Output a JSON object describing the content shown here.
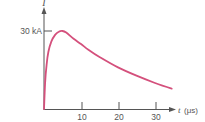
{
  "chart_data": {
    "type": "line",
    "title": "",
    "xlabel": "t (μs)",
    "ylabel": "I",
    "x_var": "t",
    "x_unit": "(μs)",
    "y_var": "I",
    "x_ticks": [
      10,
      20,
      30
    ],
    "y_ticks": [
      {
        "value": 30,
        "label": "30 kA"
      }
    ],
    "xlim": [
      0,
      36
    ],
    "ylim": [
      0,
      33
    ],
    "grid": false,
    "legend": null,
    "series": [
      {
        "name": "lightning current pulse",
        "color": "#d4507c",
        "x": [
          0,
          0.3,
          0.7,
          1.2,
          2,
          3,
          4,
          5,
          6,
          8,
          10,
          12,
          15,
          20,
          25,
          30,
          34.5
        ],
        "y": [
          0,
          10,
          17,
          22,
          26,
          28.5,
          29.7,
          30,
          29.4,
          27,
          25,
          22.8,
          20,
          16,
          12.8,
          10,
          7.8
        ]
      }
    ]
  },
  "labels": {
    "y_axis": "I",
    "y_tick": "30 kA",
    "x_axis_var": "t",
    "x_axis_unit": "(μs)",
    "x_tick_10": "10",
    "x_tick_20": "20",
    "x_tick_30": "30"
  },
  "colors": {
    "axis": "#555555",
    "curve": "#d4507c"
  }
}
